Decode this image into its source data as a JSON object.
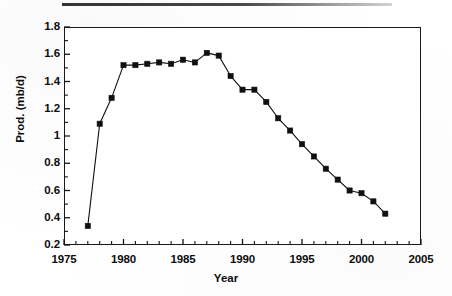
{
  "figure": {
    "background_color": "#ffffff",
    "ink_color": "#101010",
    "top_rule": "scan-rule-artifact"
  },
  "chart_data": {
    "type": "line",
    "title": "",
    "subtitle": "",
    "xlabel": "Year",
    "ylabel": "Prod. (mb/d)",
    "xlim": [
      1975,
      2005
    ],
    "ylim": [
      0.2,
      1.8
    ],
    "grid": false,
    "legend": "none",
    "marker": "filled-square",
    "line_color": "#101010",
    "marker_color": "#101010",
    "x_major_ticks": [
      1975,
      1980,
      1985,
      1990,
      1995,
      2000,
      2005
    ],
    "x_minor_tick_interval": 1,
    "x_tick_labels": [
      "1975",
      "1980",
      "1985",
      "1990",
      "1995",
      "2000",
      "2005"
    ],
    "y_major_ticks": [
      0.2,
      0.4,
      0.6,
      0.8,
      1,
      1.2,
      1.4,
      1.6,
      1.8
    ],
    "y_minor_tick_interval": 0.1,
    "y_tick_labels": [
      "0.2",
      "0.4",
      "0.6",
      "0.8",
      "1",
      "1.2",
      "1.4",
      "1.6",
      "1.8"
    ],
    "x": [
      1977,
      1978,
      1979,
      1980,
      1981,
      1982,
      1983,
      1984,
      1985,
      1986,
      1987,
      1988,
      1989,
      1990,
      1991,
      1992,
      1993,
      1994,
      1995,
      1996,
      1997,
      1998,
      1999,
      2000,
      2001,
      2002
    ],
    "values": [
      0.34,
      1.09,
      1.28,
      1.52,
      1.52,
      1.53,
      1.54,
      1.53,
      1.56,
      1.54,
      1.61,
      1.59,
      1.44,
      1.34,
      1.34,
      1.25,
      1.13,
      1.04,
      0.94,
      0.85,
      0.76,
      0.68,
      0.6,
      0.58,
      0.52,
      0.43
    ],
    "series": [
      {
        "name": "Prod. (mb/d)",
        "values": [
          0.34,
          1.09,
          1.28,
          1.52,
          1.52,
          1.53,
          1.54,
          1.53,
          1.56,
          1.54,
          1.61,
          1.59,
          1.44,
          1.34,
          1.34,
          1.25,
          1.13,
          1.04,
          0.94,
          0.85,
          0.76,
          0.68,
          0.6,
          0.58,
          0.52,
          0.43
        ]
      }
    ]
  }
}
